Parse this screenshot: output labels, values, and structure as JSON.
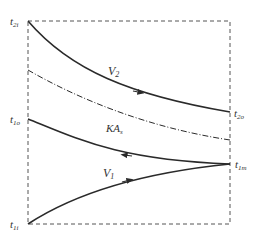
{
  "diagram": {
    "type": "temperature-profile",
    "labels": {
      "t2i": {
        "main": "t",
        "sub": "2i"
      },
      "t2o": {
        "main": "t",
        "sub": "2o"
      },
      "t1o": {
        "main": "t",
        "sub": "1o"
      },
      "t1i": {
        "main": "t",
        "sub": "1i"
      },
      "t1m": {
        "main": "t",
        "sub": "1m"
      },
      "V2": {
        "main": "V",
        "sub": "2"
      },
      "V1": {
        "main": "V",
        "sub": "1"
      },
      "KAs": {
        "main": "KA",
        "sub": "s"
      }
    },
    "colors": {
      "line": "#2a2a2a",
      "dashed_box": "#555555",
      "text": "#333333"
    }
  }
}
